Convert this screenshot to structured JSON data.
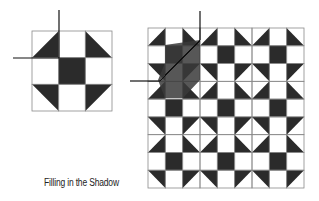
{
  "caption": "Filling in the Shadow",
  "colors": {
    "fill": "#2b2b2b",
    "shadow": "#3a3a3a",
    "grid": "#8a8a8a",
    "line": "#111111",
    "bg": "#ffffff"
  },
  "block_pattern": [
    [
      "BR",
      "W",
      "BL"
    ],
    [
      "W",
      "K",
      "W"
    ],
    [
      "TR",
      "W",
      "TL"
    ]
  ],
  "small_block": {
    "x": 32,
    "y": 31,
    "size": 80,
    "rows": 3,
    "cols": 3
  },
  "small_crosshair": {
    "vx": 59,
    "vy1": 10,
    "vy2": 58,
    "hy": 58,
    "hx1": 13,
    "hx2": 59
  },
  "large_grid": {
    "x": 148,
    "y": 28,
    "width": 156,
    "height": 160,
    "rows": 9,
    "cols": 9
  },
  "large_shadow": {
    "points": "165,45 200,40 200,63 200,80 183,98 165,98 158,80 165,63"
  },
  "large_crosshair": {
    "vx": 200,
    "vy1": 11,
    "vy2": 40,
    "hy": 81,
    "hx1": 130,
    "hx2": 160
  }
}
